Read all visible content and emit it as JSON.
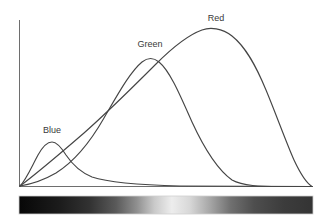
{
  "figure": {
    "background_color": "#ffffff",
    "curve_color": "#454545",
    "axis_color": "#6e6e6e",
    "label_color": "#3a3a3a"
  },
  "labels": {
    "blue": "Blue",
    "green": "Green",
    "red": "Red"
  },
  "label_positions": {
    "blue": {
      "x": 52,
      "y": 133
    },
    "green": {
      "x": 150,
      "y": 47
    },
    "red": {
      "x": 216,
      "y": 21
    }
  },
  "axes": {
    "x_start": 19,
    "x_end": 313,
    "y_top": 20,
    "y_baseline": 186,
    "show_ticks": false,
    "show_grid": false,
    "xlabel": "",
    "ylabel": ""
  },
  "spectrum_bar": {
    "name": "visible-spectrum-strip",
    "x": 19,
    "y": 196,
    "width": 294,
    "height": 18,
    "stops": [
      {
        "offset": 0,
        "color": "#070707"
      },
      {
        "offset": 0.06,
        "color": "#101010"
      },
      {
        "offset": 0.14,
        "color": "#1c1c1c"
      },
      {
        "offset": 0.24,
        "color": "#323232"
      },
      {
        "offset": 0.33,
        "color": "#5a5a5a"
      },
      {
        "offset": 0.4,
        "color": "#8f8f8f"
      },
      {
        "offset": 0.46,
        "color": "#c9c9c9"
      },
      {
        "offset": 0.52,
        "color": "#ededed"
      },
      {
        "offset": 0.58,
        "color": "#d8d8d8"
      },
      {
        "offset": 0.65,
        "color": "#a6a6a6"
      },
      {
        "offset": 0.72,
        "color": "#707070"
      },
      {
        "offset": 0.8,
        "color": "#4e4e4e"
      },
      {
        "offset": 0.9,
        "color": "#3c3c3c"
      },
      {
        "offset": 1,
        "color": "#343434"
      }
    ]
  },
  "chart_data": {
    "type": "line",
    "title": "",
    "xlabel": "",
    "ylabel": "",
    "xlim": [
      0,
      100
    ],
    "ylim": [
      0,
      100
    ],
    "grid": false,
    "legend": "inline-curve-labels",
    "x": [
      0,
      5,
      10,
      15,
      20,
      25,
      30,
      35,
      40,
      45,
      50,
      55,
      60,
      65,
      70,
      75,
      80,
      85,
      90,
      95,
      100
    ],
    "series": [
      {
        "name": "Blue",
        "label": "Blue",
        "peak_x": 11,
        "peak_y": 26,
        "values": [
          0,
          14,
          24,
          26,
          24,
          20,
          16,
          13,
          11,
          9,
          8,
          7,
          6,
          5,
          4.5,
          4,
          3.5,
          3,
          2.5,
          2,
          1.5
        ]
      },
      {
        "name": "Green",
        "label": "Green",
        "peak_x": 45,
        "peak_y": 77,
        "values": [
          0,
          4,
          9,
          16,
          26,
          39,
          53,
          65,
          74,
          77,
          76,
          71,
          62,
          51,
          39,
          28,
          18,
          11,
          6,
          3,
          1
        ]
      },
      {
        "name": "Red",
        "label": "Red",
        "peak_x": 67,
        "peak_y": 94,
        "values": [
          0,
          5,
          11,
          17,
          24,
          31,
          38,
          46,
          54,
          63,
          73,
          82,
          89,
          93,
          94,
          91,
          83,
          69,
          50,
          27,
          2
        ]
      }
    ]
  }
}
